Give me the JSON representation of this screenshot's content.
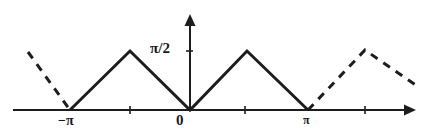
{
  "figure": {
    "background_color": "#ffffff",
    "ink_color": "#1d1d1d",
    "width": 427,
    "height": 139
  },
  "axes": {
    "x_axis_name": "x-axis",
    "y_axis_name": "y-axis",
    "x_axis_y_pixel": 110,
    "y_axis_x_pixel": 190,
    "x_axis_start_pixel": 13,
    "x_axis_end_pixel": 416,
    "y_axis_top_pixel": 14,
    "arrow_x_label": "x-axis-arrow",
    "arrow_y_label": "y-axis-arrow"
  },
  "labels": {
    "y_tick_halfpi": "π/2",
    "x_tick_neg_pi": "−π",
    "x_tick_origin": "0",
    "x_tick_pi": "π"
  },
  "ticks": {
    "y": [
      {
        "label": "π/2",
        "value": 1.5708,
        "pixel_y": 51
      }
    ],
    "x": [
      {
        "label": "−π",
        "value": -3.1416,
        "pixel_x": 70,
        "has_mark": false
      },
      {
        "label": "",
        "value": -1.5708,
        "pixel_x": 130,
        "has_mark": true
      },
      {
        "label": "0",
        "value": 0,
        "pixel_x": 190,
        "has_mark": false
      },
      {
        "label": "",
        "value": 1.5708,
        "pixel_x": 245,
        "has_mark": true
      },
      {
        "label": "π",
        "value": 3.1416,
        "pixel_x": 308,
        "has_mark": false
      },
      {
        "label": "",
        "value": 4.7124,
        "pixel_x": 365,
        "has_mark": true
      }
    ]
  },
  "chart_data": {
    "type": "line",
    "xlabel": "",
    "ylabel": "",
    "xlim": [
      -4.6,
      5.9
    ],
    "ylim": [
      0,
      1.75
    ],
    "grid": false,
    "legend": null,
    "series": [
      {
        "name": "principal-period-solid",
        "style": "solid",
        "color": "#1d1d1d",
        "x": [
          -3.1416,
          -1.5708,
          0,
          1.5708,
          3.1416
        ],
        "y": [
          0,
          1.5708,
          0,
          1.5708,
          0
        ],
        "pixel_points": "70,110 130,51 190,110 247,51 308,110"
      },
      {
        "name": "left-periodic-extension-dashed",
        "style": "dashed",
        "color": "#1d1d1d",
        "x": [
          -4.65,
          -3.1416
        ],
        "y": [
          1.52,
          0
        ],
        "pixel_points": "28,52 70,110"
      },
      {
        "name": "right-periodic-extension-dashed",
        "style": "dashed",
        "color": "#1d1d1d",
        "x": [
          3.1416,
          4.7124,
          6.15
        ],
        "y": [
          0,
          1.58,
          0.58
        ],
        "pixel_points": "308,110 365,50 420,88"
      }
    ]
  }
}
